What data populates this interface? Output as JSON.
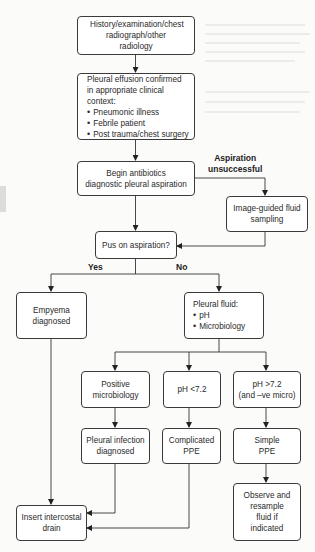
{
  "diagram": {
    "type": "flowchart",
    "nodes": {
      "start": {
        "text": "History/examination/chest radiograph/other radiology"
      },
      "effusion": {
        "title": "Pleural effusion confirmed in appropriate clinical context:",
        "bullets": [
          "Pneumonic illness",
          "Febrile patient",
          "Post trauma/chest surgery"
        ]
      },
      "antibiotics": {
        "line1": "Begin antibiotics",
        "line2": "diagnostic pleural aspiration"
      },
      "image_guided": {
        "line1": "Image-guided fluid",
        "line2": "sampling"
      },
      "pus": {
        "text": "Pus on aspiration?"
      },
      "empyema": {
        "line1": "Empyema",
        "line2": "diagnosed"
      },
      "pleural_fluid": {
        "title": "Pleural fluid:",
        "bullets": [
          "pH",
          "Microbiology"
        ]
      },
      "positive_micro": {
        "line1": "Positive",
        "line2": "microbiology"
      },
      "ph_low": {
        "text": "pH <7.2"
      },
      "ph_high": {
        "line1": "pH >7.2",
        "line2": "(and –ve micro)"
      },
      "pleural_infection": {
        "line1": "Pleural infection",
        "line2": "diagnosed"
      },
      "complicated_ppe": {
        "line1": "Complicated",
        "line2": "PPE"
      },
      "simple_ppe": {
        "line1": "Simple",
        "line2": "PPE"
      },
      "observe": {
        "lines": [
          "Observe and",
          "resample",
          "fluid if",
          "indicated"
        ]
      },
      "drain": {
        "line1": "Insert intercostal",
        "line2": "drain"
      }
    },
    "edge_labels": {
      "aspiration_unsuccessful_1": "Aspiration",
      "aspiration_unsuccessful_2": "unsuccessful",
      "yes": "Yes",
      "no": "No"
    },
    "edges": [
      [
        "start",
        "effusion"
      ],
      [
        "effusion",
        "antibiotics"
      ],
      [
        "antibiotics",
        "image_guided",
        "Aspiration unsuccessful"
      ],
      [
        "antibiotics",
        "pus"
      ],
      [
        "image_guided",
        "pus"
      ],
      [
        "pus",
        "empyema",
        "Yes"
      ],
      [
        "pus",
        "pleural_fluid",
        "No"
      ],
      [
        "pleural_fluid",
        "positive_micro"
      ],
      [
        "pleural_fluid",
        "ph_low"
      ],
      [
        "pleural_fluid",
        "ph_high"
      ],
      [
        "positive_micro",
        "pleural_infection"
      ],
      [
        "ph_low",
        "complicated_ppe"
      ],
      [
        "ph_high",
        "simple_ppe"
      ],
      [
        "simple_ppe",
        "observe"
      ],
      [
        "empyema",
        "drain"
      ],
      [
        "pleural_infection",
        "drain"
      ],
      [
        "complicated_ppe",
        "drain"
      ]
    ]
  }
}
